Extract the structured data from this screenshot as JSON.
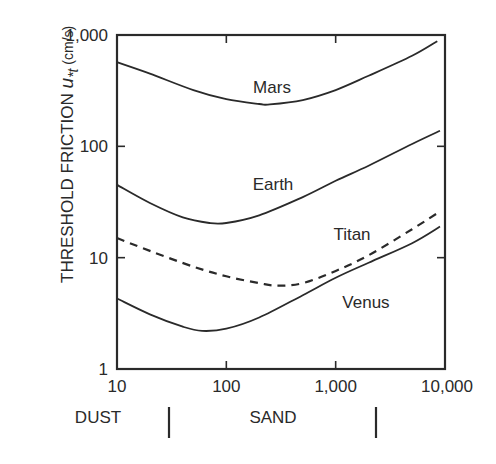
{
  "chart_data": {
    "type": "line",
    "title": "",
    "xlabel": "",
    "ylabel": "THRESHOLD FRICTION u*t (cm/s)",
    "ylabel_parts": {
      "main": "THRESHOLD FRICTION ",
      "symbol": "u",
      "subscript": "*t",
      "unit": " (cm/s)"
    },
    "xscale": "log",
    "yscale": "log",
    "xlim": [
      10,
      10000
    ],
    "ylim": [
      1,
      1000
    ],
    "x_ticks": [
      10,
      100,
      1000,
      10000
    ],
    "x_tick_labels": [
      "10",
      "100",
      "1,000",
      "10,000"
    ],
    "y_ticks": [
      1,
      10,
      100,
      1000
    ],
    "y_tick_labels": [
      "1",
      "10",
      "100",
      "1,000"
    ],
    "grid": false,
    "legend": "none (curves labeled inline)",
    "series": [
      {
        "name": "Mars",
        "style": "solid",
        "x": [
          10,
          20,
          50,
          100,
          200,
          250,
          500,
          1000,
          2000,
          5000,
          8500
        ],
        "y": [
          570,
          450,
          320,
          265,
          240,
          238,
          260,
          320,
          430,
          650,
          880
        ],
        "label_pos": {
          "x": 272,
          "y": 93
        }
      },
      {
        "name": "Earth",
        "style": "solid",
        "x": [
          10,
          20,
          40,
          70,
          100,
          200,
          500,
          1000,
          2000,
          5000,
          9000
        ],
        "y": [
          45,
          31,
          23,
          20.5,
          20.5,
          24,
          35,
          49,
          67,
          105,
          138
        ],
        "label_pos": {
          "x": 273,
          "y": 190
        }
      },
      {
        "name": "Titan",
        "style": "dashed",
        "x": [
          10,
          20,
          50,
          100,
          200,
          300,
          500,
          1000,
          2000,
          5000,
          9000
        ],
        "y": [
          15,
          11.5,
          8.3,
          6.8,
          5.9,
          5.6,
          5.9,
          7.6,
          10.5,
          18,
          26
        ],
        "label_pos": {
          "x": 352,
          "y": 240
        }
      },
      {
        "name": "Venus",
        "style": "solid",
        "x": [
          10,
          20,
          40,
          60,
          100,
          200,
          500,
          1000,
          2000,
          5000,
          9000
        ],
        "y": [
          4.3,
          3.1,
          2.4,
          2.2,
          2.3,
          2.9,
          4.6,
          6.6,
          9.0,
          13.5,
          19
        ],
        "label_pos": {
          "x": 366,
          "y": 308
        }
      }
    ],
    "annotations": [
      {
        "text": "DUST",
        "region": "10 to ~30"
      },
      {
        "text": "SAND",
        "region": "~30 to ~2000"
      }
    ],
    "band_dividers_at_x": [
      30,
      2000
    ]
  },
  "bands": {
    "dust": "DUST",
    "sand": "SAND"
  },
  "colors": {
    "ink": "#2a2a2a",
    "background": "#ffffff"
  }
}
